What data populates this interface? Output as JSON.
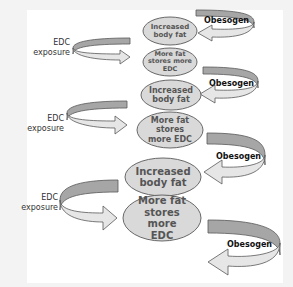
{
  "diagram": {
    "colors": {
      "background": "#f3f3f3",
      "card": "#ffffff",
      "ellipse_fill": "#d9d9d9",
      "ellipse_stroke": "#595959",
      "ellipse_text": "#555555",
      "arrow_dark": "#a6a6a6",
      "arrow_light": "#e6e6e6",
      "arrow_stroke": "#595959"
    },
    "nodes": [
      {
        "id": "n1",
        "label": "Increased body fat"
      },
      {
        "id": "n2",
        "label": "More fat stores more EDC"
      },
      {
        "id": "n3",
        "label": "Increased body fat"
      },
      {
        "id": "n4",
        "label": "More fat stores more EDC"
      },
      {
        "id": "n5",
        "label": "Increased body fat"
      },
      {
        "id": "n6",
        "label": "More fat stores more EDC"
      }
    ],
    "left_arrows": [
      {
        "label_line1": "EDC",
        "label_line2": "exposure"
      },
      {
        "label_line1": "EDC",
        "label_line2": "exposure"
      },
      {
        "label_line1": "EDC",
        "label_line2": "exposure"
      }
    ],
    "right_arrows": [
      {
        "label": "Obesogen"
      },
      {
        "label": "Obesogen"
      },
      {
        "label": "Obesogen"
      },
      {
        "label": "Obesogen"
      }
    ]
  }
}
